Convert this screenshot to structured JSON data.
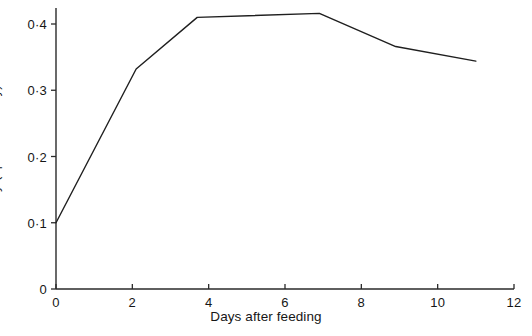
{
  "chart_data": {
    "type": "line",
    "title": "",
    "xlabel": "Days after feeding",
    "ylabel": "Protease activity (optical density)",
    "xlim": [
      0,
      12
    ],
    "ylim": [
      0,
      0.44
    ],
    "grid": false,
    "legend": null,
    "decimal_separator": "·",
    "xticks": [
      0,
      2,
      4,
      6,
      8,
      10,
      12
    ],
    "xtick_labels": [
      "0",
      "2",
      "4",
      "6",
      "8",
      "10",
      "12"
    ],
    "yticks": [
      0,
      0.1,
      0.2,
      0.3,
      0.4
    ],
    "ytick_labels": [
      "0",
      "0·1",
      "0·2",
      "0·3",
      "0·4"
    ],
    "series": [
      {
        "name": "Protease activity",
        "color": "#1f1f1f",
        "x": [
          0,
          2.1,
          3.7,
          6.9,
          8.9,
          11.0
        ],
        "y": [
          0.1,
          0.332,
          0.41,
          0.416,
          0.366,
          0.344
        ]
      }
    ]
  },
  "axis": {
    "line_color": "#2a2a2a",
    "x_title": "Days after feeding",
    "y_title": "Protease activity (optical density)"
  },
  "ticks": {
    "y": [
      {
        "label": "0·4",
        "value": 0.4
      },
      {
        "label": "0·3",
        "value": 0.3
      },
      {
        "label": "0·2",
        "value": 0.2
      },
      {
        "label": "0·1",
        "value": 0.1
      },
      {
        "label": "0",
        "value": 0
      }
    ],
    "x": [
      {
        "label": "0",
        "value": 0
      },
      {
        "label": "2",
        "value": 2
      },
      {
        "label": "4",
        "value": 4
      },
      {
        "label": "6",
        "value": 6
      },
      {
        "label": "8",
        "value": 8
      },
      {
        "label": "10",
        "value": 10
      },
      {
        "label": "12",
        "value": 12
      }
    ]
  }
}
